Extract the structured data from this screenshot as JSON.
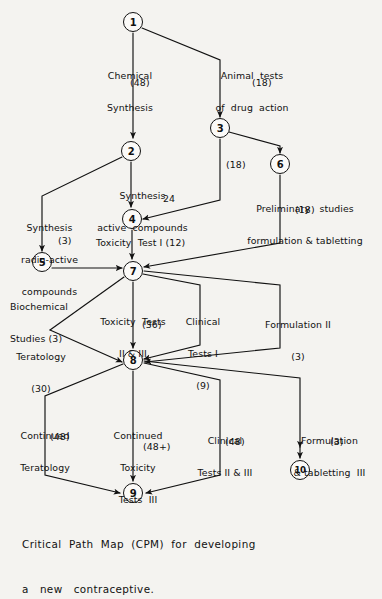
{
  "diagram": {
    "title": "Critical Path Map (CPM) for developing a new contraceptive.",
    "caption_line1": "Critical  Path  Map  (CPM)  for  developing",
    "caption_line2": "a   new   contraceptive.",
    "ink_color": "#111111",
    "paper_color": "#f4f3f0",
    "nodes": [
      {
        "id": "1",
        "label": "1",
        "x": 133,
        "y": 22
      },
      {
        "id": "2",
        "label": "2",
        "x": 131,
        "y": 151
      },
      {
        "id": "3",
        "label": "3",
        "x": 220,
        "y": 128
      },
      {
        "id": "4",
        "label": "4",
        "x": 132,
        "y": 219
      },
      {
        "id": "5",
        "label": "5",
        "x": 42,
        "y": 262
      },
      {
        "id": "6",
        "label": "6",
        "x": 280,
        "y": 164
      },
      {
        "id": "7",
        "label": "7",
        "x": 133,
        "y": 271
      },
      {
        "id": "8",
        "label": "8",
        "x": 133,
        "y": 360
      },
      {
        "id": "9",
        "label": "9",
        "x": 133,
        "y": 493
      },
      {
        "id": "10",
        "label": "10",
        "x": 300,
        "y": 470
      }
    ],
    "activities": [
      {
        "name": "chemical-synthesis",
        "text": "Chemical\nSynthesis",
        "duration": "(48)"
      },
      {
        "name": "animal-tests",
        "text": "Animal  tests\nof  drug  action",
        "duration": "(18)"
      },
      {
        "name": "synthesis-active",
        "text": "Synthesis\nactive  compounds",
        "duration": "24"
      },
      {
        "name": "synthesis-radioactive",
        "text": "Synthesis\nradio-active\ncompounds",
        "duration": "(3)"
      },
      {
        "name": "dummy-3-to-7",
        "text": "",
        "duration": "(18)"
      },
      {
        "name": "preliminary-studies",
        "text": "Preliminary   studies\nformulation & tabletting",
        "duration": "(18)"
      },
      {
        "name": "toxicity-test-1",
        "text": "Toxicity  Test I",
        "duration": "(12)"
      },
      {
        "name": "biochemical-studies",
        "text": "Biochemical\nStudies",
        "duration": "(3)"
      },
      {
        "name": "toxicity-tests-2-3",
        "text": "Toxicity  Tests\nII & III",
        "duration": "(36)"
      },
      {
        "name": "clinical-tests-1",
        "text": "Clinical\nTests I",
        "duration": "(9)"
      },
      {
        "name": "formulation-2",
        "text": "Formulation II",
        "duration": "(3)"
      },
      {
        "name": "teratology",
        "text": "Teratology",
        "duration": "(30)"
      },
      {
        "name": "continued-teratology",
        "text": "Continued\nTeratology",
        "duration": "(48)"
      },
      {
        "name": "continued-toxicity-3",
        "text": "Continued\nToxicity\nTests  III",
        "duration": "(48+)"
      },
      {
        "name": "clinical-tests-2-3",
        "text": "Clinical\nTests II & III",
        "duration": "(48)"
      },
      {
        "name": "formulation-tabletting-3",
        "text": "Formulation\n& tabletting  III",
        "duration": "(3)"
      }
    ],
    "labels": {
      "chemical_synthesis_l1": "Chemical",
      "chemical_synthesis_l2": "Synthesis",
      "chemical_synthesis_dur": "(48)",
      "animal_tests_l1": "Animal  tests",
      "animal_tests_l2": "of  drug  action",
      "animal_tests_dur": "(18)",
      "synthesis_active_l1": "Synthesis",
      "synthesis_active_l2": "active  compounds",
      "synthesis_active_dur": "24",
      "radio_l1": "Synthesis",
      "radio_l2": "radio-active",
      "radio_l3": "compounds",
      "radio_dur": "(3)",
      "dummy_3_7_dur": "(18)",
      "prelim_l1": "Preliminary   studies",
      "prelim_l2": "formulation & tabletting",
      "prelim_dur": "(18)",
      "toxicity1": "Toxicity  Test I (12)",
      "biochem_l1": "Biochemical",
      "biochem_l2": "Studies (3)",
      "tox23_l1": "Toxicity  Tests",
      "tox23_l2": "II & III",
      "tox23_dur": "(36)",
      "clin1_l1": "Clinical",
      "clin1_l2": "Tests I",
      "clin1_dur": "(9)",
      "form2_l1": "Formulation II",
      "form2_dur": "(3)",
      "terat_l1": "Teratology",
      "terat_dur": "(30)",
      "contterat_l1": "Continued",
      "contterat_l2": "Teratology",
      "contterat_dur": "(48)",
      "conttox_l1": "Continued",
      "conttox_l2": "Toxicity",
      "conttox_l3": "Tests  III",
      "conttox_dur": "(48+)",
      "clin23_l1": "Clinical",
      "clin23_l2": "Tests II & III",
      "clin23_dur": "(48)",
      "form3_l1": "Formulation",
      "form3_l2": "& tabletting  III",
      "form3_dur": "(3)"
    }
  }
}
